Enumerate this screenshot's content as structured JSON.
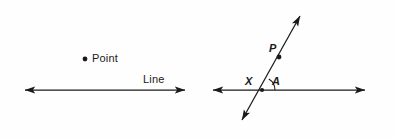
{
  "figure": {
    "background_color": "#fefefe",
    "stroke_color": "#1a1a1a"
  },
  "left_panel": {
    "name": "point-and-line-panel",
    "point_label": "Point",
    "line_label": "Line",
    "point_marker": {
      "name": "point-dot",
      "cx": 85,
      "cy": 59,
      "r": 2.4
    },
    "line": {
      "name": "horizontal-line-left",
      "x1": 22,
      "y1": 90,
      "x2": 188,
      "y2": 90,
      "arrow_start": true,
      "arrow_end": true
    }
  },
  "right_panel": {
    "name": "intersecting-lines-panel",
    "labels": {
      "P": "P",
      "X": "X",
      "A": "A"
    },
    "horizontal_line": {
      "name": "horizontal-line-right",
      "x1": 210,
      "y1": 90,
      "x2": 368,
      "y2": 90,
      "arrow_start": true,
      "arrow_end": true
    },
    "slanted_line": {
      "name": "slanted-line",
      "x1": 240,
      "y1": 124,
      "x2": 302,
      "y2": 12,
      "arrow_start": true,
      "arrow_end": true
    },
    "intersection": {
      "name": "intersection-point-X",
      "cx": 262,
      "cy": 90
    },
    "point_marker_P": {
      "name": "point-dot-P",
      "cx": 279,
      "cy": 57,
      "r": 2.4
    },
    "angle_arc": {
      "name": "angle-arc-A",
      "label": "A",
      "radius": 13
    }
  }
}
